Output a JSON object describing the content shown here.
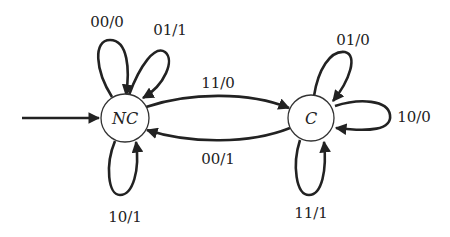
{
  "diagram": {
    "type": "finite-state-machine",
    "states": [
      {
        "id": "NC",
        "label": "NC",
        "initial": true
      },
      {
        "id": "C",
        "label": "C",
        "initial": false
      }
    ],
    "transitions": [
      {
        "from": "NC",
        "to": "NC",
        "label": "00/0"
      },
      {
        "from": "NC",
        "to": "NC",
        "label": "01/1"
      },
      {
        "from": "NC",
        "to": "NC",
        "label": "10/1"
      },
      {
        "from": "NC",
        "to": "C",
        "label": "11/0"
      },
      {
        "from": "C",
        "to": "NC",
        "label": "00/1"
      },
      {
        "from": "C",
        "to": "C",
        "label": "01/0"
      },
      {
        "from": "C",
        "to": "C",
        "label": "10/0"
      },
      {
        "from": "C",
        "to": "C",
        "label": "11/1"
      }
    ]
  }
}
